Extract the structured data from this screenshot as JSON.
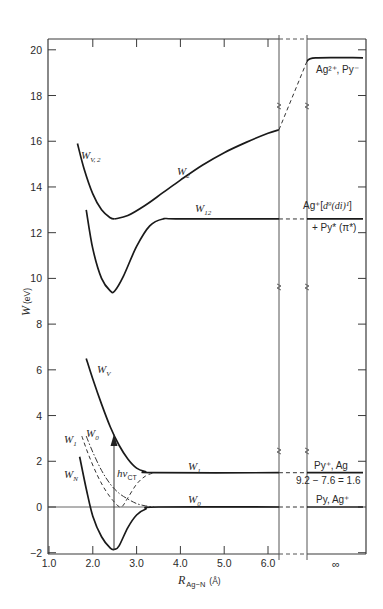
{
  "chart_data": {
    "type": "line",
    "title": "",
    "xlabel": "R_Ag-N (Å)",
    "ylabel": "W (eV)",
    "xlim": [
      1.0,
      6.5
    ],
    "ylim": [
      -2,
      20.5
    ],
    "grid": false,
    "x_ticks": [
      "1.0",
      "2.0",
      "3.0",
      "4.0",
      "5.0",
      "6.0"
    ],
    "x_tick_values": [
      1.0,
      2.0,
      3.0,
      4.0,
      5.0,
      6.0
    ],
    "x_break_label": "∞",
    "y_ticks": [
      "−2",
      "0",
      "2",
      "4",
      "6",
      "8",
      "10",
      "12",
      "14",
      "16",
      "18",
      "20"
    ],
    "y_tick_values": [
      -2,
      0,
      2,
      4,
      6,
      8,
      10,
      12,
      14,
      16,
      18,
      20
    ],
    "series": [
      {
        "name": "W_V,2",
        "style": "solid",
        "x": [
          1.65,
          1.8,
          2.0,
          2.2,
          2.4,
          2.5
        ],
        "y": [
          15.9,
          14.8,
          13.7,
          13.0,
          12.65,
          12.6
        ]
      },
      {
        "name": "W_2",
        "style": "solid",
        "x": [
          2.5,
          2.8,
          3.2,
          3.6,
          4.0,
          4.5,
          5.0,
          5.5,
          6.0,
          6.25
        ],
        "y": [
          12.6,
          12.75,
          13.2,
          13.75,
          14.3,
          14.95,
          15.5,
          15.95,
          16.35,
          16.5
        ]
      },
      {
        "name": "W_2 (to ∞)",
        "style": "dashed",
        "x": [
          6.25,
          6.9
        ],
        "y": [
          16.5,
          19.5
        ]
      },
      {
        "name": "W_2 (asymptote)",
        "style": "solid",
        "x": [
          6.9,
          7.1,
          8.2
        ],
        "y": [
          19.5,
          19.65,
          19.65
        ]
      },
      {
        "name": "W_12",
        "style": "solid",
        "x": [
          1.85,
          2.0,
          2.2,
          2.4,
          2.5,
          2.7,
          3.0,
          3.3,
          3.6,
          4.0,
          6.25
        ],
        "y": [
          13.0,
          11.3,
          10.0,
          9.45,
          9.45,
          10.1,
          11.4,
          12.3,
          12.6,
          12.6,
          12.6
        ]
      },
      {
        "name": "W_V",
        "style": "solid",
        "x": [
          1.85,
          2.0,
          2.2,
          2.4,
          2.6,
          2.8,
          3.0,
          3.2,
          3.4,
          6.25
        ],
        "y": [
          6.5,
          5.6,
          4.5,
          3.5,
          2.7,
          2.1,
          1.7,
          1.55,
          1.5,
          1.5
        ]
      },
      {
        "name": "W_N",
        "style": "solid",
        "x": [
          1.7,
          1.85,
          2.0,
          2.2,
          2.4,
          2.5,
          2.6,
          2.8,
          3.0,
          3.2,
          3.5,
          6.25
        ],
        "y": [
          2.2,
          0.8,
          -0.4,
          -1.3,
          -1.8,
          -1.85,
          -1.7,
          -0.9,
          -0.35,
          -0.1,
          0.0,
          0.0
        ]
      },
      {
        "name": "W_1 (diabatic)",
        "style": "dashed",
        "x": [
          1.75,
          1.9,
          2.1,
          2.3,
          2.5,
          2.65,
          2.8,
          3.0,
          3.2,
          3.4
        ],
        "y": [
          3.1,
          2.3,
          1.4,
          0.7,
          0.2,
          0.0,
          0.4,
          1.0,
          1.35,
          1.5
        ]
      },
      {
        "name": "W_0 (diabatic)",
        "style": "dash-dot",
        "x": [
          1.85,
          2.0,
          2.2,
          2.4,
          2.6,
          2.8,
          3.0,
          3.2,
          3.4
        ],
        "y": [
          3.1,
          2.4,
          1.6,
          1.0,
          0.6,
          0.35,
          0.15,
          0.05,
          0.0
        ]
      },
      {
        "name": "W_1 (to ∞)",
        "style": "dashed",
        "x": [
          6.25,
          6.9
        ],
        "y": [
          1.5,
          1.5
        ]
      },
      {
        "name": "W_0 (to ∞)",
        "style": "dashed",
        "x": [
          6.25,
          6.9
        ],
        "y": [
          0.0,
          0.0
        ]
      },
      {
        "name": "W_12 (to ∞)",
        "style": "dashed",
        "x": [
          6.25,
          6.9
        ],
        "y": [
          12.6,
          12.6
        ]
      },
      {
        "name": "W_1 (asymptote)",
        "style": "solid",
        "x": [
          6.9,
          8.2
        ],
        "y": [
          1.5,
          1.5
        ]
      },
      {
        "name": "W_0 (asymptote)",
        "style": "solid",
        "x": [
          6.9,
          8.2
        ],
        "y": [
          0.0,
          0.0
        ]
      },
      {
        "name": "W_12 (asymptote)",
        "style": "solid",
        "x": [
          6.9,
          8.2
        ],
        "y": [
          12.6,
          12.6
        ]
      }
    ],
    "annotations": [
      {
        "text": "hν_CT",
        "type": "vertical-arrow",
        "x": 2.5,
        "y_from": -1.85,
        "y_to": 3.4
      },
      {
        "text": "Ag²⁺, Py⁻",
        "at": "∞",
        "y": 19.65
      },
      {
        "text": "Ag⁺[d⁹(di)¹]",
        "at": "∞",
        "y": 12.6
      },
      {
        "text": "+ Py*(π*)",
        "at": "∞",
        "y": 12.6
      },
      {
        "text": "Py⁺, Ag",
        "at": "∞",
        "y": 1.5
      },
      {
        "text": "9.2 − 7.6 = 1.6",
        "at": "∞",
        "y": 1.5
      },
      {
        "text": "Py, Ag⁺",
        "at": "∞",
        "y": 0.0
      }
    ]
  },
  "labels": {
    "y_axis_main": "W",
    "y_axis_unit": "(eV)",
    "x_axis_main": "R",
    "x_axis_sub": "Ag−N",
    "x_axis_unit": "(Å)",
    "infinity": "∞",
    "WV2_main": "W",
    "WV2_sub": "V, 2",
    "W2_main": "W",
    "W2_sub": "2",
    "W12_main": "W",
    "W12_sub": "12",
    "WV_main": "W",
    "WV_sub": "V",
    "W1_left_main": "W",
    "W1_left_sub": "1",
    "W0_left_main": "W",
    "W0_left_sub": "0",
    "WN_main": "W",
    "WN_sub": "N",
    "W1_right_main": "W",
    "W1_right_sub": "1",
    "W0_right_main": "W",
    "W0_right_sub": "0",
    "hv_main": "hν",
    "hv_sub": "CT",
    "ag2_py": "Ag²⁺, Py⁻",
    "ag_d9_a": "Ag⁺[",
    "ag_d9_b": "d⁹(di)¹",
    "ag_d9_c": "]",
    "py_star": "+ Py* (π*)",
    "py_plus_ag": "Py⁺, Ag",
    "equation": "9.2 − 7.6 = 1.6",
    "py_ag_plus": "Py, Ag⁺"
  }
}
